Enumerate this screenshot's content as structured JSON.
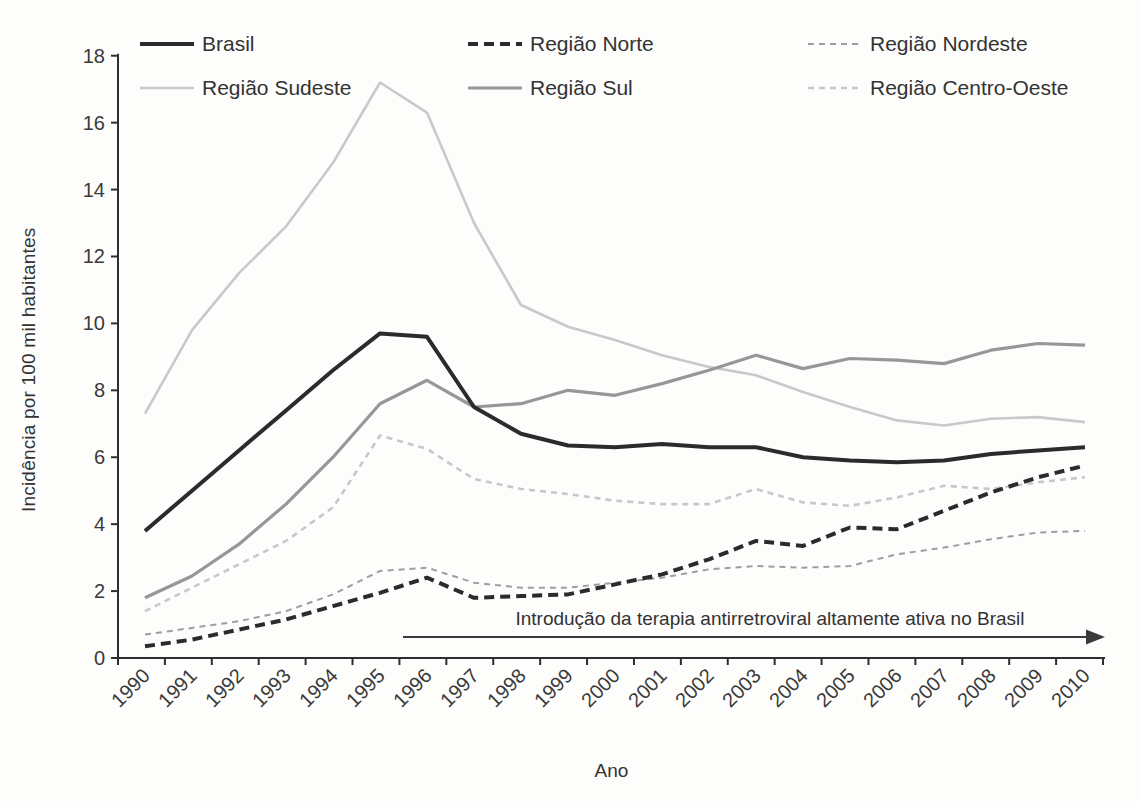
{
  "figure": {
    "y_axis_label": "Incidência por 100 mil habitantes",
    "x_axis_label": "Ano",
    "annotation": {
      "text": "Introdução da terapia antirretroviral altamente ativa no Brasil",
      "arrow_start_year": 1996,
      "arrow_end_year": 2010
    },
    "text_color": "#333333",
    "axis_color": "#2e2e2e",
    "background_color": "#fdfdfc"
  },
  "chart_data": {
    "type": "line",
    "title": "",
    "xlabel": "Ano",
    "ylabel": "Incidência por 100 mil habitantes",
    "x": [
      "1990",
      "1991",
      "1992",
      "1993",
      "1994",
      "1995",
      "1996",
      "1997",
      "1998",
      "1999",
      "2000",
      "2001",
      "2002",
      "2003",
      "2004",
      "2005",
      "2006",
      "2007",
      "2008",
      "2009",
      "2010"
    ],
    "ylim": [
      0,
      18
    ],
    "y_ticks": [
      0,
      2,
      4,
      6,
      8,
      10,
      12,
      14,
      16,
      18
    ],
    "grid": false,
    "legend_position": "top",
    "legend_rows": 2,
    "legend_columns": 3,
    "series": [
      {
        "name": "Brasil",
        "color": "#2b2b2b",
        "dash": null,
        "width": 4,
        "z": 6,
        "values": [
          3.8,
          5.0,
          6.2,
          7.4,
          8.6,
          9.7,
          9.6,
          7.5,
          6.7,
          6.35,
          6.3,
          6.4,
          6.3,
          6.3,
          6.0,
          5.9,
          5.85,
          5.9,
          6.1,
          6.2,
          6.3
        ]
      },
      {
        "name": "Região Norte",
        "color": "#2b2b2b",
        "dash": "10 6",
        "width": 4,
        "z": 5,
        "values": [
          0.35,
          0.55,
          0.85,
          1.15,
          1.55,
          1.95,
          2.4,
          1.8,
          1.85,
          1.9,
          2.2,
          2.5,
          2.95,
          3.5,
          3.35,
          3.9,
          3.85,
          4.4,
          4.95,
          5.4,
          5.75
        ]
      },
      {
        "name": "Região Nordeste",
        "color": "#9e9e9e",
        "dash": "6 5",
        "width": 2,
        "z": 3,
        "values": [
          0.7,
          0.9,
          1.1,
          1.4,
          1.9,
          2.6,
          2.7,
          2.25,
          2.1,
          2.1,
          2.25,
          2.4,
          2.65,
          2.75,
          2.7,
          2.75,
          3.1,
          3.3,
          3.55,
          3.75,
          3.8
        ]
      },
      {
        "name": "Região Sudeste",
        "color": "#c9c9c9",
        "dash": null,
        "width": 2.6,
        "z": 1,
        "values": [
          7.3,
          9.8,
          11.5,
          12.9,
          14.8,
          17.2,
          16.3,
          13.0,
          10.55,
          9.9,
          9.5,
          9.05,
          8.7,
          8.45,
          7.95,
          7.5,
          7.1,
          6.95,
          7.15,
          7.2,
          7.05
        ]
      },
      {
        "name": "Região Sul",
        "color": "#979797",
        "dash": null,
        "width": 3.2,
        "z": 4,
        "values": [
          1.8,
          2.45,
          3.4,
          4.6,
          6.0,
          7.6,
          8.3,
          7.5,
          7.6,
          8.0,
          7.85,
          8.2,
          8.6,
          9.05,
          8.65,
          8.95,
          8.9,
          8.8,
          9.2,
          9.4,
          9.35
        ]
      },
      {
        "name": "Região Centro-Oeste",
        "color": "#c8c8c8",
        "dash": "6 5",
        "width": 2.6,
        "z": 2,
        "values": [
          1.4,
          2.1,
          2.8,
          3.5,
          4.5,
          6.65,
          6.25,
          5.35,
          5.05,
          4.9,
          4.7,
          4.6,
          4.6,
          5.05,
          4.65,
          4.55,
          4.8,
          5.15,
          5.05,
          5.25,
          5.4
        ]
      }
    ]
  }
}
